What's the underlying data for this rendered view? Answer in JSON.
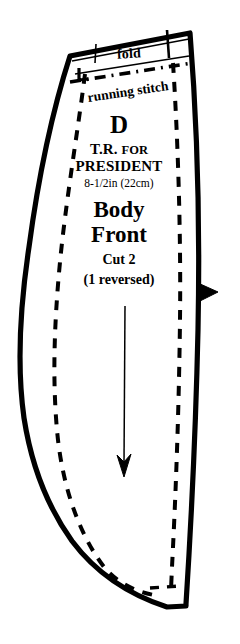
{
  "document": {
    "type": "sewing-pattern-piece",
    "background_color": "#ffffff",
    "ink_color": "#000000"
  },
  "pattern": {
    "fold_label": "fold",
    "running_stitch_label": "running stitch",
    "piece_letter": "D",
    "project_line_1": "T.R. FOR",
    "project_line_1_lead": "T.R.",
    "project_line_1_rest": "FOR",
    "project_line_2": "PRESIDENT",
    "size_label": "8-1/2in (22cm)",
    "piece_name_line_1": "Body",
    "piece_name_line_2": "Front",
    "cut_instruction": "Cut 2",
    "reversed_instruction": "(1 reversed)",
    "grainline_arrow": "grainline-arrow-down",
    "notch_marker": "notch-triangle-right",
    "cutting_line": "solid-outline",
    "seam_line": "dashed-seam-line",
    "fold_line": "solid-fold-line",
    "stitch_line": "dash-dot-running-stitch-line"
  }
}
